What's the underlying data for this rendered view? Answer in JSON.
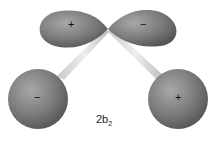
{
  "diagram": {
    "title": "2b",
    "title_subscript": "2",
    "lobes": [
      {
        "name": "upper-left-lobe",
        "sign": "+"
      },
      {
        "name": "upper-right-lobe",
        "sign": "−"
      }
    ],
    "atoms": [
      {
        "name": "left-hydrogen",
        "sign": "−"
      },
      {
        "name": "right-hydrogen",
        "sign": "+"
      }
    ],
    "colors": {
      "orbital": "#7d7d7d",
      "bond": "#d8d8d8",
      "background": "#ffffff"
    }
  }
}
